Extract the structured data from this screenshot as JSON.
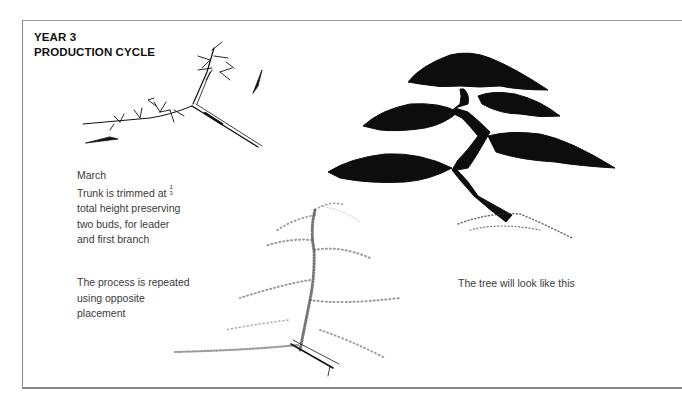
{
  "header": {
    "line1": "YEAR 3",
    "line2": "PRODUCTION CYCLE"
  },
  "captions": {
    "march": {
      "month": "March",
      "line1_prefix": "Trunk is trimmed at",
      "fraction_num": "1",
      "fraction_den": "3",
      "line2": "total height preserving",
      "line3": "two buds, for leader",
      "line4": "and first branch"
    },
    "repeat": {
      "line1": "The process is repeated",
      "line2": "using opposite",
      "line3": "placement"
    },
    "result": "The tree will look like this"
  },
  "illustrations": [
    {
      "name": "trimmed-seedling",
      "description": "trimmed trunk with two buds and arrows"
    },
    {
      "name": "stippled-tree",
      "description": "dotted sketch of tree after repeated trimming"
    },
    {
      "name": "mature-bonsai",
      "description": "silhouette of finished bonsai tree"
    }
  ],
  "colors": {
    "ink": "#111111",
    "text": "#3a3a3a",
    "frame": "#8a8a8a"
  }
}
